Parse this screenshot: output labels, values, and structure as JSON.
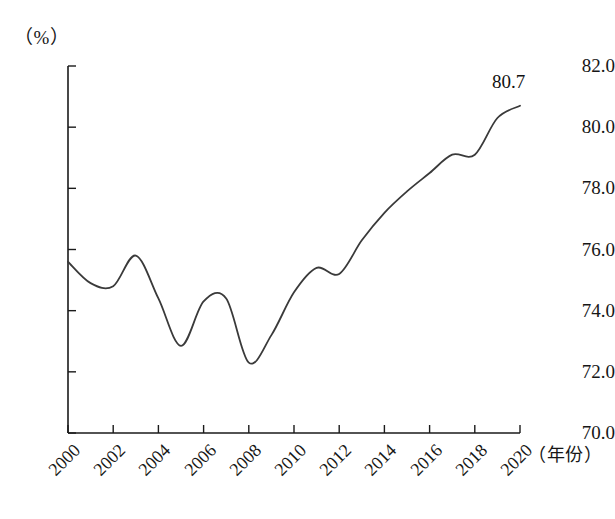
{
  "chart_data": {
    "type": "line",
    "title": "",
    "subtitle": "",
    "xlabel": "（年份）",
    "ylabel": "（%）",
    "x": [
      2000,
      2001,
      2002,
      2003,
      2004,
      2005,
      2006,
      2007,
      2008,
      2009,
      2010,
      2011,
      2012,
      2013,
      2014,
      2015,
      2016,
      2017,
      2018,
      2019,
      2020
    ],
    "values": [
      75.6,
      74.9,
      74.8,
      75.8,
      74.4,
      72.85,
      74.3,
      74.4,
      72.3,
      73.2,
      74.6,
      75.4,
      75.2,
      76.3,
      77.2,
      77.9,
      78.5,
      79.1,
      79.1,
      80.3,
      80.7
    ],
    "series": [
      {
        "name": "",
        "values": [
          75.6,
          74.9,
          74.8,
          75.8,
          74.4,
          72.85,
          74.3,
          74.4,
          72.3,
          73.2,
          74.6,
          75.4,
          75.2,
          76.3,
          77.2,
          77.9,
          78.5,
          79.1,
          79.1,
          80.3,
          80.7
        ]
      }
    ],
    "xlim": [
      2000,
      2020
    ],
    "ylim": [
      70.0,
      82.0
    ],
    "x_tick_labels": [
      "2000",
      "2002",
      "2004",
      "2006",
      "2008",
      "2010",
      "2012",
      "2014",
      "2016",
      "2018",
      "2020"
    ],
    "x_tick_values": [
      2000,
      2002,
      2004,
      2006,
      2008,
      2010,
      2012,
      2014,
      2016,
      2018,
      2020
    ],
    "y_tick_labels": [
      "70.0",
      "72.0",
      "74.0",
      "76.0",
      "78.0",
      "80.0",
      "82.0"
    ],
    "y_tick_values": [
      70.0,
      72.0,
      74.0,
      76.0,
      78.0,
      80.0,
      82.0
    ],
    "grid": false,
    "legend": "none",
    "annotations": [
      {
        "label": "80.7",
        "x": 2020,
        "y": 80.7
      }
    ],
    "line_color": "#3a3a3a",
    "axis_color": "#1a1a1a"
  }
}
